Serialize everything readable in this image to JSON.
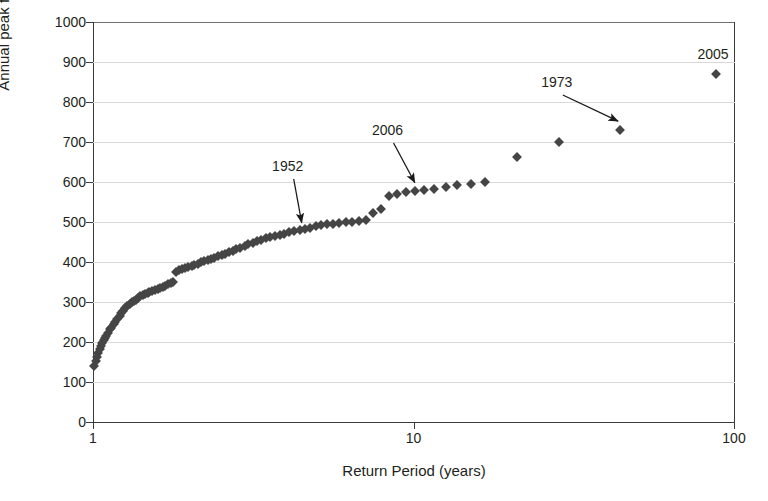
{
  "chart_data": {
    "type": "scatter",
    "title": "",
    "xlabel": "Return Period (years)",
    "ylabel": "Annual peak flow (m3s-1)",
    "ylabel_html": "Annual peak flow (m<sup>3</sup>s<sup>-1</sup>)",
    "xscale": "log",
    "yscale": "linear",
    "xlim": [
      1,
      100
    ],
    "ylim": [
      0,
      1000
    ],
    "grid": true,
    "grid_axis": "y",
    "legend": "none",
    "marker": "diamond",
    "marker_color": "#454545",
    "yticks": [
      0,
      100,
      200,
      300,
      400,
      500,
      600,
      700,
      800,
      900,
      1000
    ],
    "xticks": [
      1,
      10,
      100
    ],
    "xticklabels": [
      "1",
      "10",
      "100"
    ],
    "series": [
      {
        "name": "Annual peak flow",
        "points": [
          [
            1.01,
            140
          ],
          [
            1.02,
            152
          ],
          [
            1.03,
            163
          ],
          [
            1.04,
            172
          ],
          [
            1.05,
            182
          ],
          [
            1.06,
            190
          ],
          [
            1.07,
            198
          ],
          [
            1.08,
            205
          ],
          [
            1.09,
            210
          ],
          [
            1.1,
            215
          ],
          [
            1.11,
            222
          ],
          [
            1.13,
            232
          ],
          [
            1.14,
            236
          ],
          [
            1.16,
            244
          ],
          [
            1.17,
            250
          ],
          [
            1.19,
            258
          ],
          [
            1.21,
            265
          ],
          [
            1.22,
            272
          ],
          [
            1.24,
            278
          ],
          [
            1.26,
            284
          ],
          [
            1.28,
            290
          ],
          [
            1.3,
            296
          ],
          [
            1.32,
            300
          ],
          [
            1.34,
            303
          ],
          [
            1.36,
            306
          ],
          [
            1.38,
            310
          ],
          [
            1.4,
            314
          ],
          [
            1.43,
            317
          ],
          [
            1.45,
            320
          ],
          [
            1.48,
            322
          ],
          [
            1.5,
            325
          ],
          [
            1.53,
            328
          ],
          [
            1.56,
            330
          ],
          [
            1.59,
            333
          ],
          [
            1.62,
            335
          ],
          [
            1.65,
            338
          ],
          [
            1.68,
            341
          ],
          [
            1.71,
            344
          ],
          [
            1.75,
            347
          ],
          [
            1.78,
            350
          ],
          [
            1.82,
            376
          ],
          [
            1.86,
            379
          ],
          [
            1.9,
            382
          ],
          [
            1.94,
            385
          ],
          [
            1.98,
            388
          ],
          [
            2.03,
            390
          ],
          [
            2.07,
            393
          ],
          [
            2.12,
            396
          ],
          [
            2.17,
            399
          ],
          [
            2.22,
            402
          ],
          [
            2.28,
            405
          ],
          [
            2.33,
            408
          ],
          [
            2.39,
            411
          ],
          [
            2.45,
            414
          ],
          [
            2.52,
            417
          ],
          [
            2.58,
            420
          ],
          [
            2.65,
            424
          ],
          [
            2.73,
            428
          ],
          [
            2.8,
            432
          ],
          [
            2.88,
            436
          ],
          [
            2.97,
            440
          ],
          [
            3.05,
            444
          ],
          [
            3.15,
            448
          ],
          [
            3.24,
            452
          ],
          [
            3.35,
            456
          ],
          [
            3.46,
            459
          ],
          [
            3.57,
            462
          ],
          [
            3.69,
            465
          ],
          [
            3.82,
            468
          ],
          [
            3.95,
            471
          ],
          [
            4.1,
            474
          ],
          [
            4.25,
            477
          ],
          [
            4.41,
            480
          ],
          [
            4.58,
            483
          ],
          [
            4.76,
            486
          ],
          [
            4.95,
            489
          ],
          [
            5.16,
            492
          ],
          [
            5.38,
            494
          ],
          [
            5.61,
            496
          ],
          [
            5.87,
            498
          ],
          [
            6.14,
            500
          ],
          [
            6.44,
            501
          ],
          [
            6.76,
            503
          ],
          [
            7.11,
            505
          ],
          [
            7.49,
            523
          ],
          [
            7.91,
            533
          ],
          [
            8.37,
            566
          ],
          [
            8.88,
            570
          ],
          [
            9.45,
            574
          ],
          [
            10.1,
            578
          ],
          [
            10.8,
            580
          ],
          [
            11.6,
            583
          ],
          [
            12.6,
            588
          ],
          [
            13.7,
            592
          ],
          [
            15.1,
            594
          ],
          [
            16.7,
            600
          ],
          [
            21.0,
            663
          ],
          [
            28.5,
            700
          ],
          [
            44.0,
            730
          ],
          [
            88.0,
            870
          ]
        ]
      }
    ],
    "annotations": [
      {
        "label": "1952",
        "label_x": 4.05,
        "label_y": 640,
        "target_x": 4.48,
        "target_y": 498,
        "arrow": true
      },
      {
        "label": "2006",
        "label_x": 8.3,
        "label_y": 730,
        "target_x": 10.1,
        "target_y": 598,
        "arrow": true
      },
      {
        "label": "1973",
        "label_x": 28.0,
        "label_y": 850,
        "target_x": 43.5,
        "target_y": 752,
        "arrow": true
      },
      {
        "label": "2005",
        "label_x": 86.0,
        "label_y": 920,
        "target_x": null,
        "target_y": null,
        "arrow": false
      }
    ]
  }
}
